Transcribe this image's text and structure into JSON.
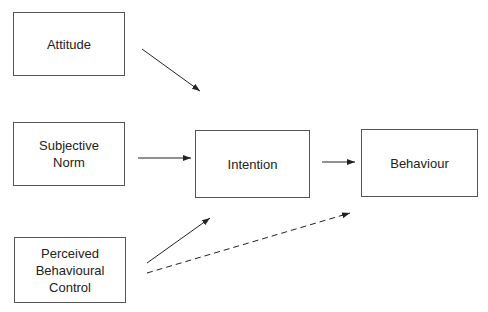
{
  "diagram": {
    "nodes": [
      {
        "id": "attitude",
        "label": "Attitude"
      },
      {
        "id": "subjective_norm",
        "label": "Subjective\nNorm"
      },
      {
        "id": "pbc",
        "label": "Perceived\nBehavioural\nControl"
      },
      {
        "id": "intention",
        "label": "Intention"
      },
      {
        "id": "behaviour",
        "label": "Behaviour"
      }
    ],
    "edges": [
      {
        "from": "attitude",
        "to": "intention",
        "style": "solid"
      },
      {
        "from": "subjective_norm",
        "to": "intention",
        "style": "solid"
      },
      {
        "from": "pbc",
        "to": "intention",
        "style": "solid"
      },
      {
        "from": "intention",
        "to": "behaviour",
        "style": "solid"
      },
      {
        "from": "pbc",
        "to": "behaviour",
        "style": "dashed"
      }
    ]
  }
}
